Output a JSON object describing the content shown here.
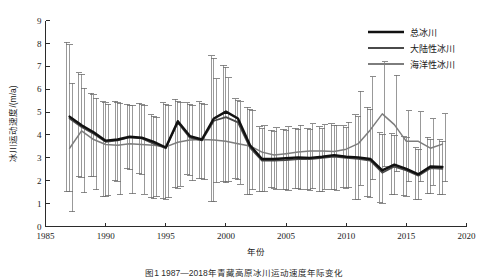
{
  "figure": {
    "caption": "图1  1987—2018年青藏高原冰川运动速度年际变化",
    "y_axis_title": "冰川运动速度/(m/a)",
    "x_axis_title": "年份"
  },
  "legend": {
    "position": "top-right",
    "items": [
      {
        "label": "总冰川",
        "color": "#111111",
        "width": 2.6
      },
      {
        "label": "大陆性冰川",
        "color": "#4a4a4a",
        "width": 2.0
      },
      {
        "label": "海洋性冰川",
        "color": "#7d7d7d",
        "width": 1.8
      }
    ]
  },
  "colors": {
    "total": "#111111",
    "continental": "#4a4a4a",
    "maritime": "#7d7d7d",
    "errorbar": "#6e6e6e",
    "axis": "#2b2b2b"
  },
  "chart_data": {
    "type": "line",
    "title": "",
    "xlabel": "年份",
    "ylabel": "冰川运动速度/(m/a)",
    "xlim": [
      1985,
      2020
    ],
    "ylim": [
      0,
      9
    ],
    "xticks": [
      1985,
      1990,
      1995,
      2000,
      2005,
      2010,
      2015,
      2020
    ],
    "yticks": [
      0,
      1,
      2,
      3,
      4,
      5,
      6,
      7,
      8,
      9
    ],
    "grid": false,
    "legend_position": "upper right",
    "x": [
      1987,
      1988,
      1989,
      1990,
      1991,
      1992,
      1993,
      1994,
      1995,
      1996,
      1997,
      1998,
      1999,
      2000,
      2001,
      2002,
      2003,
      2004,
      2005,
      2006,
      2007,
      2008,
      2009,
      2010,
      2011,
      2012,
      2013,
      2014,
      2015,
      2016,
      2017,
      2018
    ],
    "series": [
      {
        "name": "总冰川",
        "color": "#111111",
        "values": [
          4.8,
          4.42,
          4.12,
          3.75,
          3.8,
          3.92,
          3.88,
          3.7,
          3.45,
          4.6,
          3.95,
          3.8,
          4.72,
          5.02,
          4.72,
          3.55,
          2.95,
          2.95,
          2.98,
          3.02,
          3.0,
          3.05,
          3.12,
          3.05,
          3.02,
          2.95,
          2.45,
          2.7,
          2.52,
          2.28,
          2.62,
          2.6
        ],
        "error_lower": [
          1.55,
          2.18,
          2.2,
          1.32,
          2.0,
          2.52,
          2.3,
          1.25,
          1.22,
          1.7,
          2.28,
          2.1,
          1.1,
          1.95,
          2.1,
          1.4,
          1.55,
          1.7,
          1.62,
          1.68,
          1.6,
          1.55,
          1.62,
          1.7,
          1.2,
          1.3,
          1.05,
          1.4,
          1.35,
          1.2,
          1.45,
          1.4
        ],
        "error_upper": [
          8.05,
          6.72,
          5.82,
          5.45,
          5.47,
          5.35,
          5.38,
          4.88,
          5.4,
          5.55,
          5.4,
          5.45,
          7.45,
          7.05,
          5.58,
          5.2,
          4.35,
          4.2,
          4.25,
          4.3,
          4.28,
          4.35,
          4.48,
          4.4,
          4.88,
          5.2,
          4.1,
          4.05,
          3.95,
          3.45,
          3.9,
          3.8
        ]
      },
      {
        "name": "大陆性冰川",
        "color": "#4a4a4a",
        "values": [
          4.72,
          4.35,
          4.05,
          3.7,
          3.76,
          3.9,
          3.85,
          3.62,
          3.42,
          4.55,
          3.88,
          3.76,
          4.62,
          4.78,
          4.55,
          3.45,
          2.88,
          2.88,
          2.9,
          2.95,
          2.95,
          3.0,
          3.05,
          3.0,
          2.96,
          2.88,
          2.35,
          2.62,
          2.45,
          2.22,
          2.55,
          2.52
        ],
        "error_lower": [
          1.52,
          2.15,
          2.18,
          1.3,
          1.98,
          2.48,
          2.28,
          1.22,
          1.2,
          1.68,
          2.25,
          2.08,
          1.08,
          1.92,
          2.05,
          1.38,
          1.52,
          1.68,
          1.6,
          1.65,
          1.58,
          1.52,
          1.6,
          1.68,
          1.18,
          1.28,
          1.02,
          1.38,
          1.32,
          1.18,
          1.42,
          1.38
        ],
        "error_upper": [
          7.95,
          6.65,
          5.75,
          5.4,
          5.42,
          5.3,
          5.32,
          4.82,
          5.35,
          5.48,
          5.35,
          5.38,
          7.35,
          6.95,
          5.5,
          5.12,
          4.28,
          4.15,
          4.18,
          4.25,
          4.22,
          4.28,
          4.4,
          4.32,
          4.8,
          5.12,
          4.02,
          3.98,
          3.88,
          3.38,
          3.82,
          3.72
        ]
      },
      {
        "name": "海洋性冰川",
        "color": "#7d7d7d",
        "values": [
          3.42,
          4.18,
          3.8,
          3.58,
          3.55,
          3.62,
          3.58,
          3.55,
          3.48,
          3.68,
          3.78,
          3.8,
          3.78,
          3.72,
          3.62,
          3.52,
          3.25,
          3.12,
          3.18,
          3.25,
          3.3,
          3.3,
          3.28,
          3.38,
          3.62,
          4.22,
          4.92,
          4.45,
          3.72,
          3.72,
          3.42,
          3.6
        ],
        "error_lower": [
          0.65,
          1.48,
          1.6,
          1.35,
          1.38,
          1.42,
          1.4,
          1.3,
          1.25,
          1.75,
          2.0,
          2.05,
          1.92,
          1.95,
          1.85,
          1.6,
          1.55,
          1.62,
          1.58,
          1.6,
          1.65,
          1.62,
          1.58,
          1.7,
          1.8,
          2.05,
          2.62,
          2.4,
          1.95,
          1.95,
          1.8,
          1.95
        ],
        "error_upper": [
          6.25,
          6.05,
          5.6,
          5.35,
          5.38,
          5.28,
          5.3,
          4.78,
          5.3,
          5.42,
          5.3,
          5.35,
          6.45,
          6.5,
          5.45,
          5.08,
          4.4,
          4.32,
          4.35,
          4.42,
          4.48,
          4.45,
          4.42,
          4.55,
          5.9,
          6.55,
          7.2,
          6.6,
          5.05,
          5.02,
          4.7,
          4.92
        ]
      }
    ]
  }
}
